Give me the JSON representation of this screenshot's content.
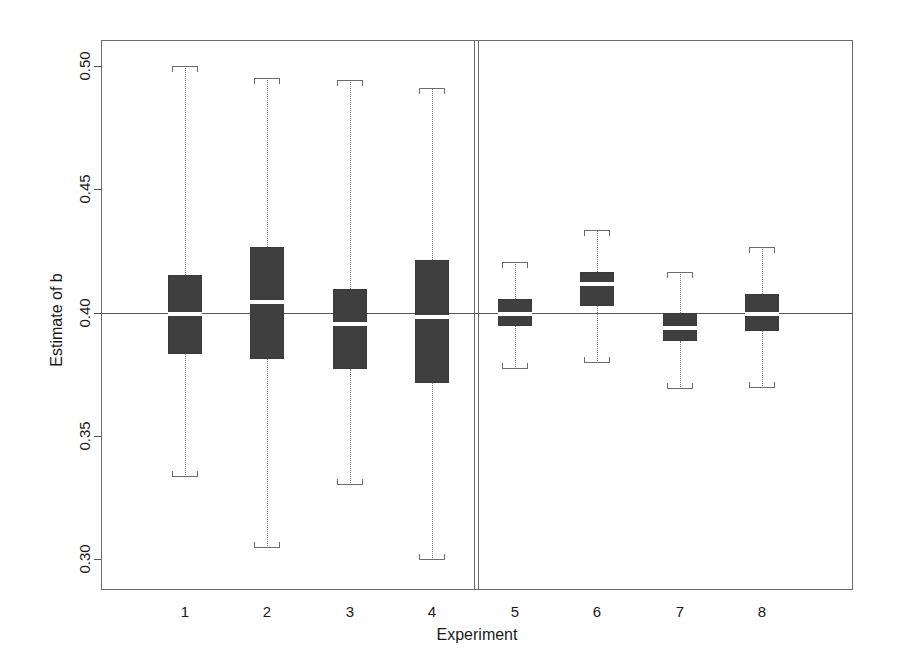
{
  "chart_data": {
    "type": "box",
    "title": "",
    "xlabel": "Experiment",
    "ylabel": "Estimate of b",
    "categories": [
      "1",
      "2",
      "3",
      "4",
      "5",
      "6",
      "7",
      "8"
    ],
    "ylim": [
      0.2875,
      0.5105
    ],
    "yticks": [
      0.3,
      0.35,
      0.4,
      0.45,
      0.5
    ],
    "ytick_labels": [
      "0.30",
      "0.35",
      "0.40",
      "0.45",
      "0.50"
    ],
    "grid": false,
    "legend": null,
    "reference_line": {
      "value": 0.4,
      "orientation": "horizontal",
      "color": "#5a5a5a"
    },
    "panel_divider": {
      "between_categories": [
        "4",
        "5"
      ],
      "color": "#6b6b6b"
    },
    "box_fill_color": "#3f3f3f",
    "median_color": "#ffffff",
    "whisker_style": "dotted",
    "cap_style": "staple-bracket",
    "boxes": [
      {
        "category": "1",
        "whisker_low": 0.3335,
        "q1": 0.383,
        "median": 0.3996,
        "q3": 0.4152,
        "whisker_high": 0.5
      },
      {
        "category": "2",
        "whisker_low": 0.3046,
        "q1": 0.3812,
        "median": 0.4042,
        "q3": 0.4266,
        "whisker_high": 0.4949
      },
      {
        "category": "3",
        "whisker_low": 0.3299,
        "q1": 0.3772,
        "median": 0.3954,
        "q3": 0.4097,
        "whisker_high": 0.4944
      },
      {
        "category": "4",
        "whisker_low": 0.2996,
        "q1": 0.3715,
        "median": 0.3981,
        "q3": 0.4212,
        "whisker_high": 0.4909
      },
      {
        "category": "5",
        "whisker_low": 0.3771,
        "q1": 0.3944,
        "median": 0.3996,
        "q3": 0.4054,
        "whisker_high": 0.4204
      },
      {
        "category": "6",
        "whisker_low": 0.3797,
        "q1": 0.4026,
        "median": 0.4114,
        "q3": 0.4165,
        "whisker_high": 0.4335
      },
      {
        "category": "7",
        "whisker_low": 0.3689,
        "q1": 0.3884,
        "median": 0.3939,
        "q3": 0.4,
        "whisker_high": 0.4165
      },
      {
        "category": "8",
        "whisker_low": 0.3694,
        "q1": 0.3924,
        "median": 0.3996,
        "q3": 0.4077,
        "whisker_high": 0.4266
      }
    ]
  },
  "axes": {
    "x_title": "Experiment",
    "y_title": "Estimate of b"
  }
}
